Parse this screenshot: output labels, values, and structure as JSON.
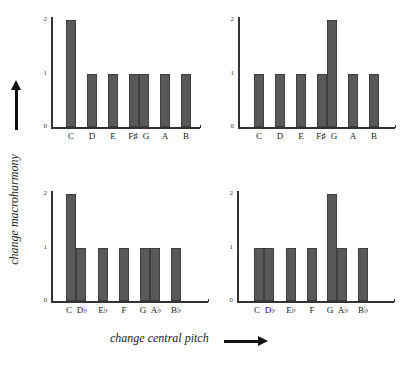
{
  "axis_titles": {
    "y": "change macroharmony",
    "x": "change central pitch"
  },
  "chart_data": [
    {
      "type": "bar",
      "panel": "top-left",
      "categories": [
        "C",
        "D",
        "E",
        "F♯",
        "G",
        "A",
        "B"
      ],
      "values": [
        2,
        1,
        1,
        1,
        1,
        1,
        1
      ],
      "yticks": [
        "0",
        "1",
        "2"
      ],
      "ylim": [
        0,
        2
      ],
      "xlabel": "change central pitch",
      "ylabel": "change macroharmony"
    },
    {
      "type": "bar",
      "panel": "top-right",
      "categories": [
        "C",
        "D",
        "E",
        "F♯",
        "G",
        "A",
        "B"
      ],
      "values": [
        1,
        1,
        1,
        1,
        2,
        1,
        1
      ],
      "yticks": [
        "0",
        "1",
        "2"
      ],
      "ylim": [
        0,
        2
      ],
      "xlabel": "change central pitch",
      "ylabel": "change macroharmony"
    },
    {
      "type": "bar",
      "panel": "bottom-left",
      "categories": [
        "C",
        "D♭",
        "E♭",
        "F",
        "G",
        "A♭",
        "B♭"
      ],
      "values": [
        2,
        1,
        1,
        1,
        1,
        1,
        1
      ],
      "yticks": [
        "0",
        "1",
        "2"
      ],
      "ylim": [
        0,
        2
      ],
      "xlabel": "change central pitch",
      "ylabel": "change macroharmony"
    },
    {
      "type": "bar",
      "panel": "bottom-right",
      "categories": [
        "C",
        "D♭",
        "E♭",
        "F",
        "G",
        "A♭",
        "B♭"
      ],
      "values": [
        1,
        1,
        1,
        1,
        2,
        1,
        1
      ],
      "yticks": [
        "0",
        "1",
        "2"
      ],
      "ylim": [
        0,
        2
      ],
      "xlabel": "change central pitch",
      "ylabel": "change macroharmony"
    }
  ],
  "colors": {
    "bar": "#595959",
    "axis": "#333333"
  }
}
